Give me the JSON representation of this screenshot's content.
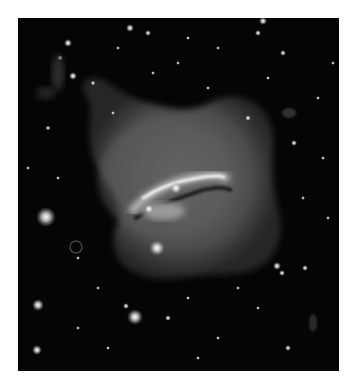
{
  "image": {
    "subject": "galaxy with dust lane and diffuse halo on star field",
    "alt": "Grayscale astronomical image of a galaxy with a bright central dust lane, diffuse irregular halo, surrounded by many stars",
    "colors": {
      "background": "#ffffff",
      "sky": "#050505",
      "halo": "#5a5a5a",
      "core": "#e8e8e8"
    }
  }
}
